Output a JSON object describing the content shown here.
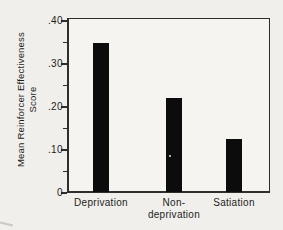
{
  "figure": {
    "page_background": "#f0efeb",
    "plot_background": "#f5f4f0",
    "axis_color": "#2e2e2c",
    "bar_color": "#0c0c0c",
    "text_color": "#1d1d1b"
  },
  "chart_data": {
    "type": "bar",
    "title": "",
    "xlabel": "",
    "ylabel": "Mean Reinforcer Effectiveness Score",
    "ylabel_lines": [
      "Mean Reinforcer Effectiveness",
      "Score"
    ],
    "categories": [
      "Deprivation",
      "Non-deprivation",
      "Satiation"
    ],
    "category_label_lines": [
      [
        "Deprivation"
      ],
      [
        "Non-",
        "deprivation"
      ],
      [
        "Satiation"
      ]
    ],
    "values": [
      0.35,
      0.22,
      0.125
    ],
    "ylim": [
      0,
      0.4
    ],
    "yticks": [
      {
        "value": 0.4,
        "label": ".40"
      },
      {
        "value": 0.3,
        "label": ".30"
      },
      {
        "value": 0.2,
        "label": ".20"
      },
      {
        "value": 0.1,
        "label": ".10"
      },
      {
        "value": 0.0,
        "label": "0"
      }
    ],
    "minor_tick_values": [
      0.05,
      0.15,
      0.25,
      0.35
    ],
    "grid": false,
    "legend": false,
    "bar_color": "#0c0c0c"
  }
}
